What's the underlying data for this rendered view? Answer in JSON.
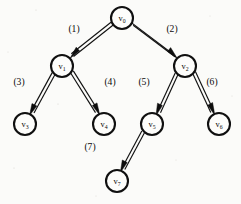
{
  "figure": {
    "type": "directed-tree-diagram",
    "background_color": "#fbfbf9",
    "ink_color": "#101010",
    "width": 241,
    "height": 204
  },
  "nodes": [
    {
      "id": "v0",
      "label": "v",
      "subscript": "0",
      "cx": 122,
      "cy": 18,
      "r": 11
    },
    {
      "id": "v1",
      "label": "v",
      "subscript": "1",
      "cx": 62,
      "cy": 66,
      "r": 11
    },
    {
      "id": "v2",
      "label": "v",
      "subscript": "2",
      "cx": 185,
      "cy": 66,
      "r": 11
    },
    {
      "id": "v3",
      "label": "v",
      "subscript": "3",
      "cx": 25,
      "cy": 124,
      "r": 11
    },
    {
      "id": "v4",
      "label": "v",
      "subscript": "4",
      "cx": 104,
      "cy": 124,
      "r": 11
    },
    {
      "id": "v5",
      "label": "v",
      "subscript": "5",
      "cx": 152,
      "cy": 124,
      "r": 11
    },
    {
      "id": "v6",
      "label": "v",
      "subscript": "6",
      "cx": 219,
      "cy": 124,
      "r": 11
    },
    {
      "id": "v7",
      "label": "v",
      "subscript": "7",
      "cx": 117,
      "cy": 181,
      "r": 11
    }
  ],
  "edges": [
    {
      "id": "e1",
      "label": "(1)",
      "from": "v0",
      "to": "v1",
      "label_x": 74,
      "label_y": 32
    },
    {
      "id": "e2",
      "label": "(2)",
      "from": "v0",
      "to": "v2",
      "label_x": 172,
      "label_y": 32
    },
    {
      "id": "e3",
      "label": "(3)",
      "from": "v1",
      "to": "v3",
      "label_x": 19,
      "label_y": 85
    },
    {
      "id": "e4",
      "label": "(4)",
      "from": "v1",
      "to": "v4",
      "label_x": 110,
      "label_y": 85
    },
    {
      "id": "e5",
      "label": "(5)",
      "from": "v2",
      "to": "v5",
      "label_x": 144,
      "label_y": 85
    },
    {
      "id": "e6",
      "label": "(6)",
      "from": "v2",
      "to": "v6",
      "label_x": 212,
      "label_y": 85
    },
    {
      "id": "e7",
      "label": "(7)",
      "from": "v5",
      "to": "v7",
      "label_x": 90,
      "label_y": 150
    }
  ]
}
